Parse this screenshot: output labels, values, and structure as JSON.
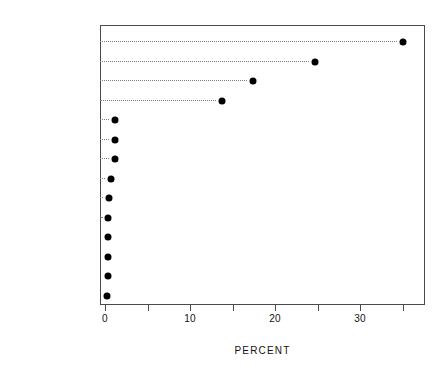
{
  "chart_data": {
    "type": "scatter",
    "subtype": "cleveland-dot-plot",
    "title": "",
    "xlabel": "PERCENT",
    "ylabel": "",
    "xlim": [
      -1.0,
      37.2
    ],
    "ylim_categories_top_to_bottom": true,
    "grid": false,
    "legend": null,
    "leader_lines": "dotted",
    "marker": "filled-circle",
    "marker_color": "#000000",
    "axis_color": "#4a4a4a",
    "xticks_major": [
      0,
      10,
      20,
      30
    ],
    "xtick_labels": [
      "0",
      "10",
      "20",
      "30"
    ],
    "xticks_minor": [
      5,
      15,
      25,
      35
    ],
    "categories": [
      "OXYGEN",
      "IRON",
      "SILICON",
      "MAGNESIUM",
      "ALUMINUM",
      "NICKEL",
      "CALCIUM",
      "SODIUM",
      "CHROMIUM",
      "PHOSPHORUS",
      "MANGANESE",
      "COBALT",
      "POTASSIUM",
      "TITANIUM"
    ],
    "values": [
      35.1,
      24.7,
      17.4,
      13.8,
      1.2,
      1.2,
      1.2,
      0.7,
      0.45,
      0.4,
      0.35,
      0.3,
      0.3,
      0.25
    ],
    "points": [
      {
        "category": "OXYGEN",
        "value": 35.1
      },
      {
        "category": "IRON",
        "value": 24.7
      },
      {
        "category": "SILICON",
        "value": 17.4
      },
      {
        "category": "MAGNESIUM",
        "value": 13.8
      },
      {
        "category": "ALUMINUM",
        "value": 1.2
      },
      {
        "category": "NICKEL",
        "value": 1.2
      },
      {
        "category": "CALCIUM",
        "value": 1.2
      },
      {
        "category": "SODIUM",
        "value": 0.7
      },
      {
        "category": "CHROMIUM",
        "value": 0.45
      },
      {
        "category": "PHOSPHORUS",
        "value": 0.4
      },
      {
        "category": "MANGANESE",
        "value": 0.35
      },
      {
        "category": "COBALT",
        "value": 0.3
      },
      {
        "category": "POTASSIUM",
        "value": 0.3
      },
      {
        "category": "TITANIUM",
        "value": 0.25
      }
    ]
  }
}
